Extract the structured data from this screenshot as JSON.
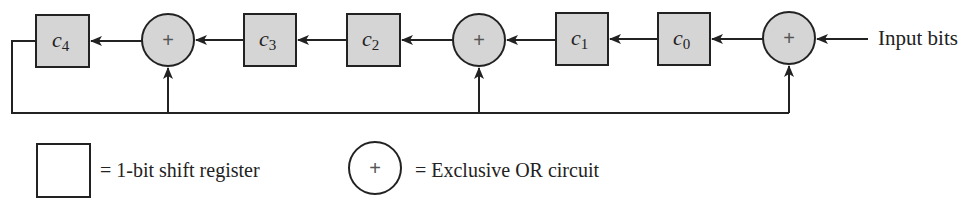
{
  "diagram": {
    "type": "CRC shift-register circuit",
    "colors": {
      "fill": "#d5d5d5",
      "stroke": "#222222",
      "background": "#ffffff"
    },
    "registers": [
      {
        "name": "c",
        "sub": "4"
      },
      {
        "name": "c",
        "sub": "3"
      },
      {
        "name": "c",
        "sub": "2"
      },
      {
        "name": "c",
        "sub": "1"
      },
      {
        "name": "c",
        "sub": "0"
      }
    ],
    "xor_symbol": "+",
    "input_label": "Input bits",
    "legend": {
      "register": "= 1-bit shift register",
      "xor": "= Exclusive OR circuit",
      "xor_symbol": "+"
    }
  }
}
